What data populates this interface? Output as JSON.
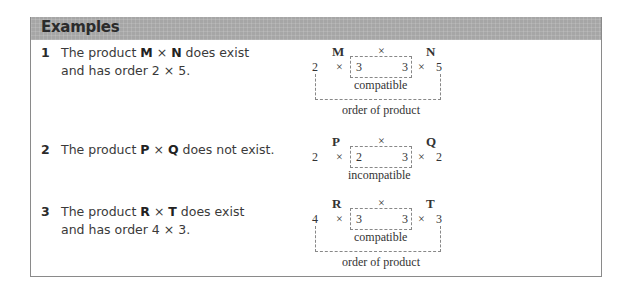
{
  "header": {
    "title": "Examples"
  },
  "examples": [
    {
      "number": "1",
      "line1_pre": "The product ",
      "a": "M",
      "times": " × ",
      "b": "N",
      "line1_post": " does exist",
      "line2": "and has order 2 × 5.",
      "diagram": {
        "left_label": "M",
        "op": "×",
        "right_label": "N",
        "r1": "2",
        "x1": "×",
        "c1": "3",
        "c2": "3",
        "x2": "×",
        "c3": "5",
        "inner_label": "compatible",
        "outer_label": "order of product"
      }
    },
    {
      "number": "2",
      "line1_pre": "The product ",
      "a": "P",
      "times": " × ",
      "b": "Q",
      "line1_post": " does not exist.",
      "line2": "",
      "diagram": {
        "left_label": "P",
        "op": "×",
        "right_label": "Q",
        "r1": "2",
        "x1": "×",
        "c1": "2",
        "c2": "3",
        "x2": "×",
        "c3": "2",
        "inner_label": "incompatible"
      }
    },
    {
      "number": "3",
      "line1_pre": "The product ",
      "a": "R",
      "times": " × ",
      "b": "T",
      "line1_post": " does exist",
      "line2": "and has order 4 × 3.",
      "diagram": {
        "left_label": "R",
        "op": "×",
        "right_label": "T",
        "r1": "4",
        "x1": "×",
        "c1": "3",
        "c2": "3",
        "x2": "×",
        "c3": "3",
        "inner_label": "compatible",
        "outer_label": "order of product"
      }
    }
  ]
}
